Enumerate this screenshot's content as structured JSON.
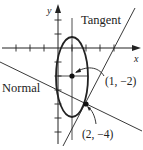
{
  "diagram": {
    "type": "ellipse-tangent-normal",
    "labels": {
      "x_axis": "x",
      "y_axis": "y",
      "tangent": "Tangent",
      "normal": "Normal",
      "center_point": "(1, −2)",
      "tangency_point": "(2, −4)"
    },
    "points": {
      "center": {
        "x": 1,
        "y": -2
      },
      "tangency": {
        "x": 2,
        "y": -4
      }
    },
    "axes": {
      "x_ticks": [
        -3,
        -2,
        -1,
        1,
        2,
        3,
        4
      ],
      "y_ticks": [
        2,
        1,
        -1,
        -2,
        -3,
        -4,
        -5,
        -6
      ]
    },
    "colors": {
      "stroke": "#222222",
      "background": "#ffffff"
    }
  }
}
